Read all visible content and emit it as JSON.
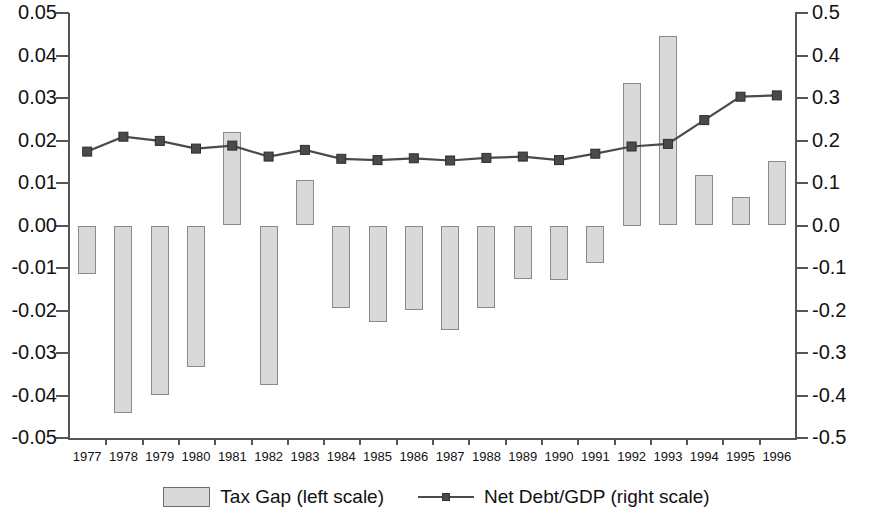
{
  "chart_data": {
    "type": "bar",
    "title": "",
    "subtitle": "",
    "xlabel": "",
    "categories": [
      "1977",
      "1978",
      "1979",
      "1980",
      "1981",
      "1982",
      "1983",
      "1984",
      "1985",
      "1986",
      "1987",
      "1988",
      "1989",
      "1990",
      "1991",
      "1992",
      "1993",
      "1994",
      "1995",
      "1996"
    ],
    "grid": false,
    "legend_position": "bottom",
    "axes": {
      "left": {
        "label": "Tax Gap (left scale)",
        "ylim": [
          -0.05,
          0.05
        ],
        "tick_step": 0.01,
        "ticks": [
          0.05,
          0.04,
          0.03,
          0.02,
          0.01,
          0.0,
          -0.01,
          -0.02,
          -0.03,
          -0.04,
          -0.05
        ],
        "tick_labels": [
          "0.05",
          "0.04",
          "0.03",
          "0.02",
          "0.01",
          "0.00",
          "-0.01",
          "-0.02",
          "-0.03",
          "-0.04",
          "-0.05"
        ]
      },
      "right": {
        "label": "Net Debt/GDP (right scale)",
        "ylim": [
          -0.5,
          0.5
        ],
        "tick_step": 0.1,
        "ticks": [
          0.5,
          0.4,
          0.3,
          0.2,
          0.1,
          0.0,
          -0.1,
          -0.2,
          -0.3,
          -0.4,
          -0.5
        ],
        "tick_labels": [
          "0.5",
          "0.4",
          "0.3",
          "0.2",
          "0.1",
          "0.0",
          "-0.1",
          "-0.2",
          "-0.3",
          "-0.4",
          "-0.5"
        ]
      }
    },
    "series": [
      {
        "name": "Tax Gap (left scale)",
        "type": "bar",
        "axis": "left",
        "color": "#d9d9d9",
        "edge_color": "#8a8a8a",
        "values": [
          -0.0115,
          -0.0442,
          -0.0398,
          -0.0332,
          0.0221,
          -0.0375,
          0.0107,
          -0.0193,
          -0.0228,
          -0.0198,
          -0.0247,
          -0.0195,
          -0.0125,
          -0.0129,
          -0.0089,
          0.0335,
          0.0447,
          0.0118,
          0.0066,
          0.0152
        ]
      },
      {
        "name": "Net Debt/GDP (right scale)",
        "type": "line",
        "axis": "right",
        "color": "#4a4a4a",
        "marker": "square",
        "values": [
          0.174,
          0.209,
          0.199,
          0.181,
          0.188,
          0.162,
          0.178,
          0.157,
          0.154,
          0.158,
          0.153,
          0.159,
          0.162,
          0.154,
          0.169,
          0.186,
          0.192,
          0.248,
          0.303,
          0.306
        ]
      }
    ]
  },
  "legend": {
    "items": [
      {
        "label": "Tax Gap (left scale)",
        "marker": "bar-swatch"
      },
      {
        "label": "Net Debt/GDP (right scale)",
        "marker": "line-square"
      }
    ]
  }
}
